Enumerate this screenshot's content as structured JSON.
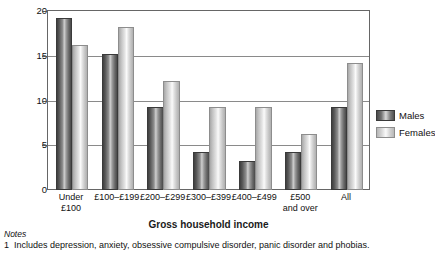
{
  "chart_data": {
    "type": "bar",
    "title": "",
    "xlabel": "Gross household income",
    "ylabel": "Percentages",
    "ylim": [
      0,
      20
    ],
    "yticks": [
      0,
      5,
      10,
      15,
      20
    ],
    "ytick_labels": [
      "0",
      "5",
      "10",
      "15",
      "20"
    ],
    "grid": true,
    "legend_position": "right",
    "categories": [
      "Under £100",
      "£100–£199",
      "£200–£299",
      "£300–£399",
      "£400–£499",
      "£500 and over",
      "All"
    ],
    "category_lines": [
      [
        "Under",
        "£100"
      ],
      [
        "£100–£199"
      ],
      [
        "£200–£299"
      ],
      [
        "£300–£399"
      ],
      [
        "£400–£499"
      ],
      [
        "£500",
        "and over"
      ],
      [
        "All"
      ]
    ],
    "series": [
      {
        "name": "Males",
        "values": [
          19,
          15,
          9,
          4,
          3,
          4,
          9
        ]
      },
      {
        "name": "Females",
        "values": [
          16,
          18,
          12,
          9,
          9,
          6,
          14
        ]
      }
    ]
  },
  "legend": {
    "items": [
      {
        "label": "Males"
      },
      {
        "label": "Females"
      }
    ]
  },
  "notes": {
    "heading": "Notes",
    "items": [
      {
        "number": "1",
        "text": "Includes depression, anxiety, obsessive compulsive disorder, panic disorder and phobias."
      }
    ]
  }
}
